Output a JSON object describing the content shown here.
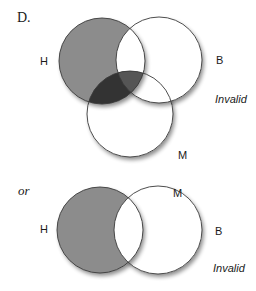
{
  "figure": {
    "heading": "D.",
    "separator": "or",
    "colors": {
      "background": "#ffffff",
      "outline": "#3a3a3a",
      "shade": "#8c8c8c",
      "shade_dark": "#333333",
      "shade_mid": "#555555"
    }
  },
  "diagram_top": {
    "sets": [
      {
        "label": "H",
        "cx": 102,
        "cy": 61,
        "r": 43
      },
      {
        "label": "B",
        "cx": 159,
        "cy": 60,
        "r": 43
      },
      {
        "label": "M",
        "cx": 130,
        "cy": 114,
        "r": 43
      }
    ],
    "shaded_regions": [
      "H only",
      "H and M",
      "H and B and M"
    ],
    "verdict": "Invalid"
  },
  "diagram_bottom": {
    "sets": [
      {
        "label": "H",
        "cx": 100,
        "cy": 230,
        "r": 43
      },
      {
        "label": "B",
        "cx": 158,
        "cy": 230,
        "r": 44
      }
    ],
    "extra_label": "M",
    "shaded_regions": [
      "H only"
    ],
    "verdict": "Invalid"
  }
}
